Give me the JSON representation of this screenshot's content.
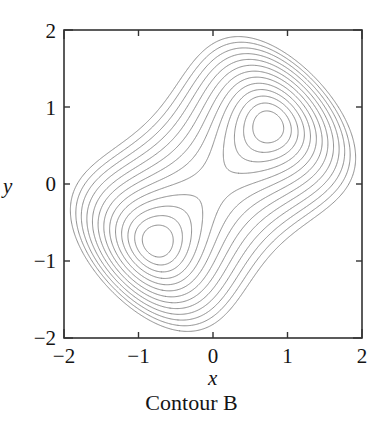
{
  "figure": {
    "caption": "Contour B",
    "xlabel": "x",
    "ylabel": "y"
  },
  "chart_data": {
    "type": "line",
    "subtype": "contour",
    "title": "Contour B",
    "xlabel": "x",
    "ylabel": "y",
    "xlim": [
      -2,
      2
    ],
    "ylim": [
      -2,
      2
    ],
    "xticks": [
      -2,
      -1,
      0,
      1,
      2
    ],
    "yticks": [
      -2,
      -1,
      0,
      1,
      2
    ],
    "xtick_labels": [
      "−2",
      "−1",
      "0",
      "1",
      "2"
    ],
    "ytick_labels": [
      "−2",
      "−1",
      "0",
      "1",
      "2"
    ],
    "grid": false,
    "legend": false,
    "frame": "box",
    "tick_direction": "in",
    "line_color": "#8a8a8a",
    "line_width": 1.0,
    "background": "#ffffff",
    "n_levels": 13,
    "levels": [
      0.06,
      0.14,
      0.24,
      0.36,
      0.5,
      0.66,
      0.84,
      1.04,
      1.26,
      1.5,
      1.76,
      2.04,
      2.34
    ],
    "extrema": [
      {
        "kind": "minimum",
        "x": -0.8,
        "y": -0.7
      },
      {
        "kind": "minimum",
        "x": 0.8,
        "y": 0.7
      },
      {
        "kind": "saddle",
        "x": 0.0,
        "y": 0.0
      }
    ],
    "field": {
      "form": "a*(u*u - c)^2 + b*v*v",
      "u": "(x + y)/sqrt(2)",
      "v": "(y - x)/sqrt(2)",
      "a": 0.33,
      "b": 1.35,
      "c": 1.12
    }
  }
}
